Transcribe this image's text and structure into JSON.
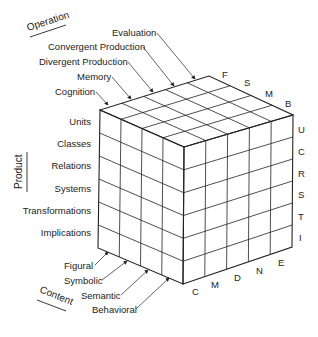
{
  "diagram": {
    "axes": {
      "operation": {
        "title": "Operation",
        "items": [
          "Evaluation",
          "Convergent Production",
          "Divergent Production",
          "Memory",
          "Cognition"
        ],
        "codes": [
          "E",
          "N",
          "D",
          "M",
          "C"
        ]
      },
      "product": {
        "title": "Product",
        "items": [
          "Units",
          "Classes",
          "Relations",
          "Systems",
          "Transformations",
          "Implications"
        ],
        "codes": [
          "U",
          "C",
          "R",
          "S",
          "T",
          "I"
        ]
      },
      "content": {
        "title": "Content",
        "items": [
          "Figural",
          "Symbolic",
          "Semantic",
          "Behavioral"
        ],
        "codes": [
          "F",
          "S",
          "M",
          "B"
        ]
      }
    },
    "top_edge_codes": [
      "F",
      "S",
      "M",
      "B"
    ],
    "right_edge_codes": [
      "U",
      "C",
      "R",
      "S",
      "T",
      "I"
    ],
    "bottom_edge_codes": [
      "C",
      "M",
      "D",
      "N",
      "E"
    ],
    "colors": {
      "line": "#222222",
      "background": "#ffffff"
    }
  }
}
